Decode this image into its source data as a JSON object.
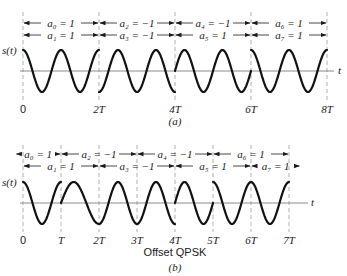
{
  "figure": {
    "panels": [
      {
        "id": "a",
        "caption": "(a)",
        "subtitle": "",
        "y_label": "s(t)",
        "x_label": "t",
        "ticks": [
          "0",
          "2T",
          "4T",
          "6T",
          "8T"
        ],
        "tick_units": [
          0,
          2,
          4,
          6,
          8
        ],
        "dashed_units": [
          0,
          2,
          4,
          6,
          8
        ],
        "label_rows": [
          [
            {
              "text": "a₀ = 1",
              "from": 0,
              "to": 2
            },
            {
              "text": "a₂ = −1",
              "from": 2,
              "to": 4
            },
            {
              "text": "a₄ = −1",
              "from": 4,
              "to": 6
            },
            {
              "text": "a₆ = 1",
              "from": 6,
              "to": 8
            }
          ],
          [
            {
              "text": "a₁ = 1",
              "from": 0,
              "to": 2
            },
            {
              "text": "a₃ = −1",
              "from": 2,
              "to": 4
            },
            {
              "text": "a₅ = 1",
              "from": 4,
              "to": 6
            },
            {
              "text": "a₇ = 1",
              "from": 6,
              "to": 8
            }
          ]
        ],
        "wave_segments": [
          {
            "from": 0,
            "to": 2,
            "phase": "cos"
          },
          {
            "from": 2,
            "to": 4,
            "phase": "-cos"
          },
          {
            "from": 4,
            "to": 6,
            "phase": "sin"
          },
          {
            "from": 6,
            "to": 8,
            "phase": "cos"
          }
        ]
      },
      {
        "id": "b",
        "caption": "(b)",
        "subtitle": "Offset QPSK",
        "y_label": "s(t)",
        "x_label": "t",
        "ticks": [
          "0",
          "T",
          "2T",
          "3T",
          "4T",
          "5T",
          "6T",
          "7T"
        ],
        "tick_units": [
          0,
          1,
          2,
          3,
          4,
          5,
          6,
          7
        ],
        "dashed_units": [
          0,
          1,
          2,
          3,
          4,
          5,
          6,
          7
        ],
        "label_rows": [
          [
            {
              "text": "a₀ = 1",
              "from": -0.2,
              "to": 1
            },
            {
              "text": "a₂ = −1",
              "from": 1,
              "to": 3
            },
            {
              "text": "a₄ = −1",
              "from": 3,
              "to": 5
            },
            {
              "text": "a₆ = 1",
              "from": 5,
              "to": 7
            }
          ],
          [
            {
              "text": "a₁ = 1",
              "from": 0,
              "to": 2
            },
            {
              "text": "a₃ = −1",
              "from": 2,
              "to": 4
            },
            {
              "text": "a₅ = 1",
              "from": 4,
              "to": 6
            },
            {
              "text": "a₇ = 1",
              "from": 6,
              "to": 7.3
            }
          ]
        ],
        "wave_segments": [
          {
            "from": 0,
            "to": 1,
            "phase": "cos"
          },
          {
            "from": 1,
            "to": 2,
            "phase": "sin-to-trough"
          },
          {
            "from": 2,
            "to": 4,
            "phase": "-cos"
          },
          {
            "from": 4,
            "to": 5,
            "phase": "sin"
          },
          {
            "from": 5,
            "to": 7,
            "phase": "cos"
          }
        ]
      }
    ]
  }
}
